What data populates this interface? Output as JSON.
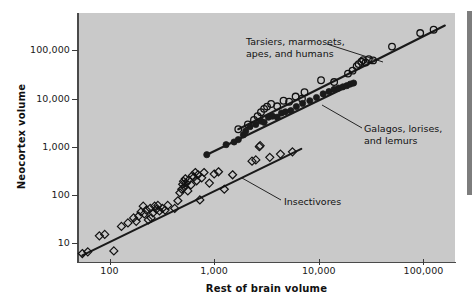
{
  "chart_data": {
    "type": "scatter",
    "title": "",
    "xlabel": "Rest of brain volume",
    "ylabel": "Neocortex volume",
    "xscale": "log",
    "yscale": "log",
    "xlim": [
      50,
      200000
    ],
    "ylim": [
      4,
      600000
    ],
    "xticks": [
      100,
      1000,
      10000,
      100000
    ],
    "xticklabels": [
      "100",
      "1,000",
      "10,000",
      "100,000"
    ],
    "yticks": [
      10,
      100,
      1000,
      10000,
      100000
    ],
    "yticklabels": [
      "10",
      "100",
      "1,000",
      "10,000",
      "100,000"
    ],
    "grid": false,
    "legend_position": "none",
    "background_color": "#c9c9c9",
    "marker_color": "#1a1a1a",
    "line_color": "#1a1a1a",
    "annotations": [
      {
        "name": "tarsiers-annotation",
        "text_lines": [
          "Tarsiers, marmosets,",
          "apes, and humans"
        ],
        "text_x": 246,
        "text_y": 36,
        "leader_from": [
          327,
          44
        ],
        "leader_to": [
          383,
          62
        ]
      },
      {
        "name": "galagos-annotation",
        "text_lines": [
          "Galagos, lorises,",
          "and lemurs"
        ],
        "text_x": 364,
        "text_y": 123,
        "leader_from": [
          362,
          128
        ],
        "leader_to": [
          322,
          105
        ]
      },
      {
        "name": "insectivores-annotation",
        "text_lines": [
          "Insectivores"
        ],
        "text_x": 284,
        "text_y": 196,
        "leader_from": [
          281,
          200
        ],
        "leader_to": [
          242,
          178
        ]
      }
    ],
    "series": [
      {
        "name": "Tarsiers, marmosets, apes, and humans",
        "marker": "open-circle",
        "fit_line": {
          "x": [
            1700,
            160000
          ],
          "y": [
            2300,
            330000
          ]
        },
        "points": [
          [
            1700,
            2300
          ],
          [
            2100,
            2900
          ],
          [
            2400,
            3600
          ],
          [
            2600,
            4300
          ],
          [
            2800,
            5200
          ],
          [
            3000,
            6100
          ],
          [
            3200,
            6800
          ],
          [
            3500,
            7700
          ],
          [
            4000,
            6900
          ],
          [
            4600,
            9000
          ],
          [
            5200,
            8600
          ],
          [
            6000,
            11000
          ],
          [
            6900,
            9900
          ],
          [
            7300,
            13500
          ],
          [
            10500,
            24000
          ],
          [
            14000,
            22000
          ],
          [
            19000,
            33000
          ],
          [
            21000,
            38000
          ],
          [
            23000,
            47000
          ],
          [
            24000,
            52000
          ],
          [
            25500,
            58000
          ],
          [
            26500,
            63000
          ],
          [
            28000,
            56000
          ],
          [
            30000,
            66000
          ],
          [
            33000,
            62000
          ],
          [
            50000,
            120000
          ],
          [
            93000,
            230000
          ],
          [
            125000,
            270000
          ]
        ]
      },
      {
        "name": "Galagos, lorises, and lemurs",
        "marker": "filled-circle",
        "fit_line": {
          "x": [
            850,
            22000
          ],
          "y": [
            680,
            21000
          ]
        },
        "points": [
          [
            850,
            680
          ],
          [
            1300,
            1100
          ],
          [
            1550,
            1250
          ],
          [
            1700,
            1400
          ],
          [
            1900,
            1750
          ],
          [
            2000,
            2100
          ],
          [
            2200,
            2600
          ],
          [
            2500,
            2900
          ],
          [
            2800,
            3400
          ],
          [
            3000,
            3200
          ],
          [
            3300,
            4100
          ],
          [
            3600,
            4300
          ],
          [
            4000,
            4100
          ],
          [
            4400,
            5000
          ],
          [
            4800,
            5300
          ],
          [
            5400,
            5600
          ],
          [
            6100,
            6800
          ],
          [
            7000,
            7900
          ],
          [
            8200,
            9000
          ],
          [
            9500,
            10500
          ],
          [
            11000,
            12500
          ],
          [
            12500,
            14000
          ],
          [
            14000,
            15500
          ],
          [
            15500,
            16500
          ],
          [
            17000,
            17500
          ],
          [
            18500,
            18500
          ],
          [
            20000,
            20000
          ],
          [
            21500,
            21000
          ]
        ]
      },
      {
        "name": "Insectivores",
        "marker": "open-diamond",
        "fit_line": {
          "x": [
            55,
            6800
          ],
          "y": [
            5.5,
            900
          ]
        },
        "points": [
          [
            55,
            6
          ],
          [
            62,
            6.5
          ],
          [
            80,
            14
          ],
          [
            90,
            15
          ],
          [
            110,
            6.8
          ],
          [
            130,
            22
          ],
          [
            150,
            26
          ],
          [
            170,
            33
          ],
          [
            180,
            28
          ],
          [
            190,
            36
          ],
          [
            200,
            44
          ],
          [
            210,
            58
          ],
          [
            215,
            40
          ],
          [
            225,
            48
          ],
          [
            235,
            30
          ],
          [
            245,
            52
          ],
          [
            250,
            33
          ],
          [
            260,
            42
          ],
          [
            270,
            58
          ],
          [
            280,
            50
          ],
          [
            290,
            60
          ],
          [
            300,
            46
          ],
          [
            320,
            52
          ],
          [
            340,
            48
          ],
          [
            360,
            60
          ],
          [
            420,
            52
          ],
          [
            450,
            75
          ],
          [
            470,
            110
          ],
          [
            490,
            130
          ],
          [
            500,
            165
          ],
          [
            510,
            190
          ],
          [
            520,
            145
          ],
          [
            530,
            215
          ],
          [
            540,
            175
          ],
          [
            560,
            120
          ],
          [
            570,
            200
          ],
          [
            600,
            160
          ],
          [
            620,
            250
          ],
          [
            640,
            230
          ],
          [
            660,
            290
          ],
          [
            680,
            195
          ],
          [
            700,
            260
          ],
          [
            730,
            78
          ],
          [
            760,
            225
          ],
          [
            800,
            290
          ],
          [
            900,
            175
          ],
          [
            1000,
            270
          ],
          [
            1100,
            300
          ],
          [
            1250,
            130
          ],
          [
            1500,
            260
          ],
          [
            2300,
            500
          ],
          [
            2500,
            530
          ],
          [
            2700,
            1000
          ],
          [
            2750,
            1050
          ],
          [
            3400,
            600
          ],
          [
            4300,
            700
          ],
          [
            5600,
            780
          ]
        ]
      }
    ]
  },
  "axes": {
    "x_title": "Rest of brain volume",
    "y_title": "Neocortex volume"
  },
  "decorations": {
    "right_bar_name": "page-edge-bar"
  }
}
